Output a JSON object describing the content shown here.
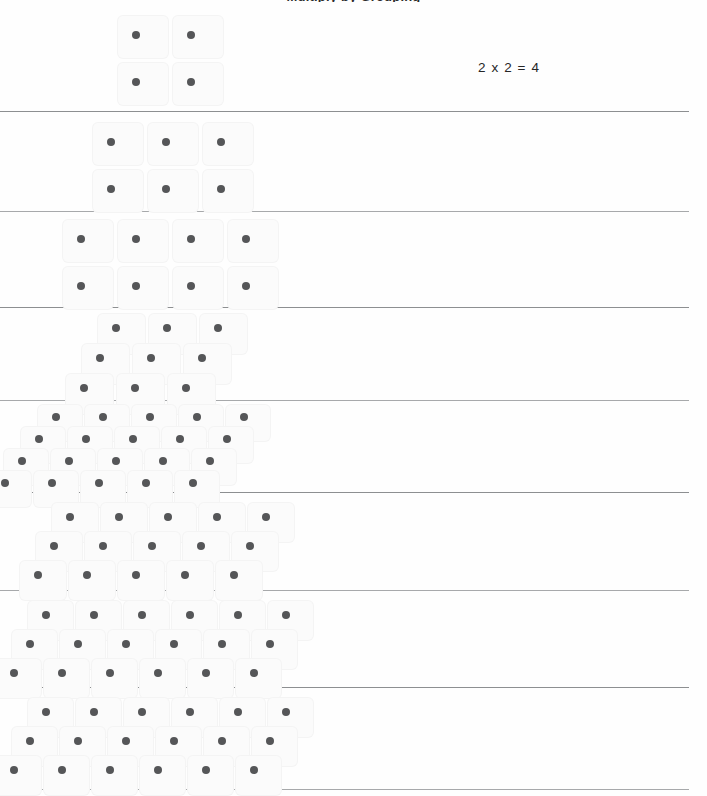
{
  "page": {
    "title_clipped": "Multiply by Grouping",
    "width": 707,
    "height": 796,
    "background_color": "#fefefe",
    "dot_color": "#555658",
    "rule_color": "#8d8f91",
    "cell_color": "#fbfbfb"
  },
  "equations": [
    {
      "id": "eq-row-1",
      "text": "2 x 2 = 4",
      "x": 478,
      "y": 60
    }
  ],
  "rules": [
    {
      "id": "rule-1",
      "y": 111,
      "width": 689
    },
    {
      "id": "rule-2",
      "y": 211,
      "width": 689
    },
    {
      "id": "rule-3",
      "y": 307,
      "width": 689
    },
    {
      "id": "rule-4",
      "y": 400,
      "width": 689
    },
    {
      "id": "rule-5",
      "y": 492,
      "width": 689
    },
    {
      "id": "rule-6",
      "y": 590,
      "width": 689
    },
    {
      "id": "rule-7",
      "y": 687,
      "width": 689
    },
    {
      "id": "rule-8",
      "y": 789,
      "width": 689
    }
  ],
  "arrays": [
    {
      "id": "array-1",
      "label": "2 by 2 array",
      "rows": 2,
      "cols": 2,
      "count": 4,
      "origin_x": 118,
      "origin_y": 16,
      "col_step": 55,
      "row_step": 47,
      "skew_x": 0,
      "cell_w": 50,
      "cell_h": 42,
      "dot_size": 8,
      "dot_offset_x": 14,
      "dot_offset_y": 15
    },
    {
      "id": "array-2",
      "label": "2 by 3 array",
      "rows": 2,
      "cols": 3,
      "count": 6,
      "origin_x": 93,
      "origin_y": 123,
      "col_step": 55,
      "row_step": 47,
      "skew_x": 0,
      "cell_w": 50,
      "cell_h": 42,
      "dot_size": 8,
      "dot_offset_x": 14,
      "dot_offset_y": 15
    },
    {
      "id": "array-3",
      "label": "2 by 4 array",
      "rows": 2,
      "cols": 4,
      "count": 8,
      "origin_x": 63,
      "origin_y": 220,
      "col_step": 55,
      "row_step": 47,
      "skew_x": 0,
      "cell_w": 50,
      "cell_h": 42,
      "dot_size": 8,
      "dot_offset_x": 14,
      "dot_offset_y": 15
    },
    {
      "id": "array-4",
      "label": "3 by 3 skewed array",
      "rows": 3,
      "cols": 3,
      "count": 9,
      "origin_x": 98,
      "origin_y": 314,
      "col_step": 51,
      "row_step": 30,
      "skew_x": -16,
      "cell_w": 47,
      "cell_h": 40,
      "dot_size": 8,
      "dot_offset_x": 14,
      "dot_offset_y": 10
    },
    {
      "id": "array-5",
      "label": "4 by 5 skewed array",
      "rows": 4,
      "cols": 5,
      "count": 20,
      "origin_x": 38,
      "origin_y": 405,
      "col_step": 47,
      "row_step": 22,
      "skew_x": -17,
      "cell_w": 44,
      "cell_h": 36,
      "dot_size": 8,
      "dot_offset_x": 14,
      "dot_offset_y": 8
    },
    {
      "id": "array-6",
      "label": "3 by 5 skewed array",
      "rows": 3,
      "cols": 5,
      "count": 15,
      "origin_x": 52,
      "origin_y": 503,
      "col_step": 49,
      "row_step": 29,
      "skew_x": -16,
      "cell_w": 46,
      "cell_h": 39,
      "dot_size": 8,
      "dot_offset_x": 14,
      "dot_offset_y": 10
    },
    {
      "id": "array-7",
      "label": "3 by 6 skewed array",
      "rows": 3,
      "cols": 6,
      "count": 18,
      "origin_x": 28,
      "origin_y": 601,
      "col_step": 48,
      "row_step": 29,
      "skew_x": -16,
      "cell_w": 45,
      "cell_h": 39,
      "dot_size": 8,
      "dot_offset_x": 14,
      "dot_offset_y": 10
    },
    {
      "id": "array-8",
      "label": "3 by 6 skewed array",
      "rows": 3,
      "cols": 6,
      "count": 18,
      "origin_x": 28,
      "origin_y": 698,
      "col_step": 48,
      "row_step": 29,
      "skew_x": -16,
      "cell_w": 45,
      "cell_h": 39,
      "dot_size": 8,
      "dot_offset_x": 14,
      "dot_offset_y": 10
    }
  ]
}
